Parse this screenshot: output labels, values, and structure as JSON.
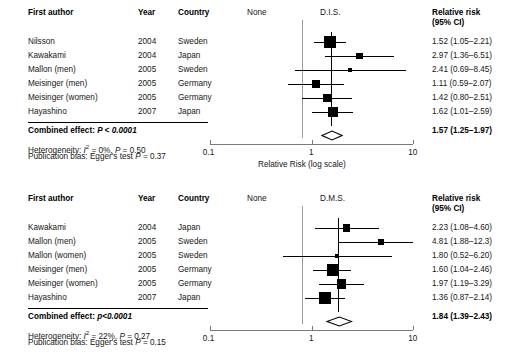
{
  "figure": {
    "type": "forest-plot",
    "panels": [
      {
        "id": "dis",
        "group_label": "D.I.S.",
        "reference_label": "None",
        "headers": {
          "author": "First author",
          "year": "Year",
          "country": "Country",
          "rr_line1": "Relative risk",
          "rr_line2": "(95% CI)"
        },
        "rows": [
          {
            "author": "Nilsson",
            "year": "2004",
            "country": "Sweden",
            "rr_text": "1.52 (1.05–2.21)",
            "rr": 1.52,
            "lcl": 1.05,
            "ucl": 2.21,
            "weight": 22.0
          },
          {
            "author": "Kawakami",
            "year": "2004",
            "country": "Japan",
            "rr_text": "2.97 (1.36–6.51)",
            "rr": 2.97,
            "lcl": 1.36,
            "ucl": 6.51,
            "weight": 7.0
          },
          {
            "author": "Mallon (men)",
            "year": "2005",
            "country": "Sweden",
            "rr_text": "2.41 (0.69–8.45)",
            "rr": 2.41,
            "lcl": 0.69,
            "ucl": 8.45,
            "weight": 2.5
          },
          {
            "author": "Meisinger (men)",
            "year": "2005",
            "country": "Germany",
            "rr_text": "1.11 (0.59–2.07)",
            "rr": 1.11,
            "lcl": 0.59,
            "ucl": 2.07,
            "weight": 9.0
          },
          {
            "author": "Meisinger (women)",
            "year": "2005",
            "country": "Germany",
            "rr_text": "1.42 (0.80–2.51)",
            "rr": 1.42,
            "lcl": 0.8,
            "ucl": 2.51,
            "weight": 11.0
          },
          {
            "author": "Hayashino",
            "year": "2007",
            "country": "Japan",
            "rr_text": "1.62 (1.01–2.59)",
            "rr": 1.62,
            "lcl": 1.01,
            "ucl": 2.59,
            "weight": 14.0
          }
        ],
        "combined": {
          "label": "Combined effect: ",
          "p_text": "P < 0.0001",
          "rr_text": "1.57 (1.25–1.97)",
          "rr": 1.57,
          "lcl": 1.25,
          "ucl": 1.97
        },
        "footnotes": {
          "heterogeneity_prefix": "Heterogeneity: ",
          "heterogeneity_i": "I",
          "heterogeneity_sup": "2",
          "heterogeneity_rest": " = 0%, ",
          "heterogeneity_p": "P",
          "heterogeneity_pval": " = 0.50",
          "pubbias_prefix": "Publication bias: Egger's test ",
          "pubbias_p": "P",
          "pubbias_pval": " = 0.37"
        },
        "axis": {
          "ticks": [
            "0.1",
            "1",
            "10"
          ],
          "min": 0.1,
          "max": 10,
          "scale": "log",
          "title": "Relative Risk (log scale)"
        }
      },
      {
        "id": "dms",
        "group_label": "D.M.S.",
        "reference_label": "None",
        "headers": {
          "author": "First author",
          "year": "Year",
          "country": "Country",
          "rr_line1": "Relative risk",
          "rr_line2": "(95% CI)"
        },
        "rows": [
          {
            "author": "Kawakami",
            "year": "2004",
            "country": "Japan",
            "rr_text": "2.23 (1.08–4.60)",
            "rr": 2.23,
            "lcl": 1.08,
            "ucl": 4.6,
            "weight": 8.0
          },
          {
            "author": "Mallon (men)",
            "year": "2005",
            "country": "Sweden",
            "rr_text": "4.81 (1.88–12.3)",
            "rr": 4.81,
            "lcl": 1.88,
            "ucl": 12.3,
            "weight": 5.0
          },
          {
            "author": "Mallon (women)",
            "year": "2005",
            "country": "Sweden",
            "rr_text": "1.80 (0.52–6.20)",
            "rr": 1.8,
            "lcl": 0.52,
            "ucl": 6.2,
            "weight": 2.5
          },
          {
            "author": "Meisinger (men)",
            "year": "2005",
            "country": "Germany",
            "rr_text": "1.60 (1.04–2.46)",
            "rr": 1.6,
            "lcl": 1.04,
            "ucl": 2.46,
            "weight": 19.0
          },
          {
            "author": "Meisinger (women)",
            "year": "2005",
            "country": "Germany",
            "rr_text": "1.97 (1.19–3.29)",
            "rr": 1.97,
            "lcl": 1.19,
            "ucl": 3.29,
            "weight": 14.0
          },
          {
            "author": "Hayashino",
            "year": "2007",
            "country": "Japan",
            "rr_text": "1.36 (0.87–2.14)",
            "rr": 1.36,
            "lcl": 0.87,
            "ucl": 2.14,
            "weight": 20.0
          }
        ],
        "combined": {
          "label": "Combined effect: ",
          "p_text": "p<0.0001",
          "rr_text": "1.84 (1.39–2.43)",
          "rr": 1.84,
          "lcl": 1.39,
          "ucl": 2.43
        },
        "footnotes": {
          "heterogeneity_prefix": "Heterogeneity: ",
          "heterogeneity_i": "I",
          "heterogeneity_sup": "2",
          "heterogeneity_rest": " = 22%, ",
          "heterogeneity_p": "P",
          "heterogeneity_pval": " = 0.27",
          "pubbias_prefix": "Publication bias: Egger's test ",
          "pubbias_p": "P",
          "pubbias_pval": " = 0.15"
        },
        "axis": {
          "ticks": [
            "0.1",
            "1",
            "10"
          ],
          "min": 0.1,
          "max": 10,
          "scale": "log",
          "title": ""
        }
      }
    ]
  },
  "chart_data": {
    "type": "forest",
    "title": "",
    "xlabel": "Relative Risk (log scale)",
    "xscale": "log",
    "xlim": [
      0.1,
      10
    ],
    "xticks": [
      0.1,
      1,
      10
    ],
    "null_value": 1,
    "panels": [
      {
        "name": "D.I.S.",
        "comparison": "None vs D.I.S.",
        "studies": [
          "Nilsson",
          "Kawakami",
          "Mallon (men)",
          "Meisinger (men)",
          "Meisinger (women)",
          "Hayashino"
        ],
        "years": [
          2004,
          2004,
          2005,
          2005,
          2005,
          2007
        ],
        "countries": [
          "Sweden",
          "Japan",
          "Sweden",
          "Germany",
          "Germany",
          "Japan"
        ],
        "rr": [
          1.52,
          2.97,
          2.41,
          1.11,
          1.42,
          1.62
        ],
        "lcl": [
          1.05,
          1.36,
          0.69,
          0.59,
          0.8,
          1.01
        ],
        "ucl": [
          2.21,
          6.51,
          8.45,
          2.07,
          2.51,
          2.59
        ],
        "summary": {
          "rr": 1.57,
          "lcl": 1.25,
          "ucl": 1.97,
          "p": "< 0.0001"
        },
        "heterogeneity": {
          "I2": "0%",
          "p": 0.5
        },
        "egger_p": 0.37
      },
      {
        "name": "D.M.S.",
        "comparison": "None vs D.M.S.",
        "studies": [
          "Kawakami",
          "Mallon (men)",
          "Mallon (women)",
          "Meisinger (men)",
          "Meisinger (women)",
          "Hayashino"
        ],
        "years": [
          2004,
          2005,
          2005,
          2005,
          2005,
          2007
        ],
        "countries": [
          "Japan",
          "Sweden",
          "Sweden",
          "Germany",
          "Germany",
          "Japan"
        ],
        "rr": [
          2.23,
          4.81,
          1.8,
          1.6,
          1.97,
          1.36
        ],
        "lcl": [
          1.08,
          1.88,
          0.52,
          1.04,
          1.19,
          0.87
        ],
        "ucl": [
          4.6,
          12.3,
          6.2,
          2.46,
          3.29,
          2.14
        ],
        "summary": {
          "rr": 1.84,
          "lcl": 1.39,
          "ucl": 2.43,
          "p": "<0.0001"
        },
        "heterogeneity": {
          "I2": "22%",
          "p": 0.27
        },
        "egger_p": 0.15
      }
    ]
  }
}
